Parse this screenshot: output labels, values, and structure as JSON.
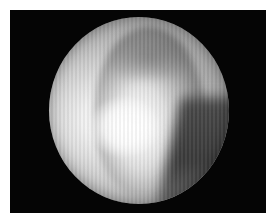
{
  "image": {
    "description": "Circular endoscopic grayscale view on black background",
    "background_color": "#050505",
    "border_color": "#ffffff"
  }
}
